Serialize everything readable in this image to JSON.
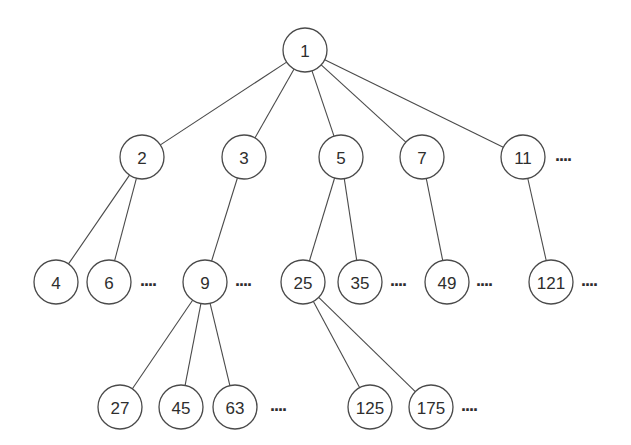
{
  "diagram": {
    "type": "tree",
    "node_radius": 22,
    "colors": {
      "stroke": "#4a4a4a",
      "fill": "#ffffff",
      "text": "#2e2e2e"
    },
    "nodes": [
      {
        "id": "n1",
        "label": "1",
        "x": 305,
        "y": 50
      },
      {
        "id": "n2",
        "label": "2",
        "x": 142,
        "y": 157
      },
      {
        "id": "n3",
        "label": "3",
        "x": 244,
        "y": 157
      },
      {
        "id": "n5",
        "label": "5",
        "x": 341,
        "y": 157
      },
      {
        "id": "n7",
        "label": "7",
        "x": 422,
        "y": 157
      },
      {
        "id": "n11",
        "label": "11",
        "x": 523,
        "y": 157
      },
      {
        "id": "n4",
        "label": "4",
        "x": 56,
        "y": 282
      },
      {
        "id": "n6",
        "label": "6",
        "x": 109,
        "y": 282
      },
      {
        "id": "n9",
        "label": "9",
        "x": 205,
        "y": 282
      },
      {
        "id": "n25",
        "label": "25",
        "x": 303,
        "y": 282
      },
      {
        "id": "n35",
        "label": "35",
        "x": 360,
        "y": 282
      },
      {
        "id": "n49",
        "label": "49",
        "x": 447,
        "y": 282
      },
      {
        "id": "n121",
        "label": "121",
        "x": 551,
        "y": 282
      },
      {
        "id": "n27",
        "label": "27",
        "x": 120,
        "y": 407
      },
      {
        "id": "n45",
        "label": "45",
        "x": 181,
        "y": 407
      },
      {
        "id": "n63",
        "label": "63",
        "x": 235,
        "y": 407
      },
      {
        "id": "n125",
        "label": "125",
        "x": 370,
        "y": 407
      },
      {
        "id": "n175",
        "label": "175",
        "x": 431,
        "y": 407
      }
    ],
    "edges": [
      {
        "from": "n1",
        "to": "n2"
      },
      {
        "from": "n1",
        "to": "n3"
      },
      {
        "from": "n1",
        "to": "n5"
      },
      {
        "from": "n1",
        "to": "n7"
      },
      {
        "from": "n1",
        "to": "n11"
      },
      {
        "from": "n2",
        "to": "n4"
      },
      {
        "from": "n2",
        "to": "n6"
      },
      {
        "from": "n3",
        "to": "n9"
      },
      {
        "from": "n5",
        "to": "n25"
      },
      {
        "from": "n5",
        "to": "n35"
      },
      {
        "from": "n7",
        "to": "n49"
      },
      {
        "from": "n11",
        "to": "n121"
      },
      {
        "from": "n9",
        "to": "n27"
      },
      {
        "from": "n9",
        "to": "n45"
      },
      {
        "from": "n9",
        "to": "n63"
      },
      {
        "from": "n25",
        "to": "n125"
      },
      {
        "from": "n25",
        "to": "n175"
      }
    ],
    "ellipses": [
      {
        "after": "n11",
        "text": "....",
        "x": 555,
        "y": 157
      },
      {
        "after": "n6",
        "text": "....",
        "x": 140,
        "y": 282
      },
      {
        "after": "n9",
        "text": "....",
        "x": 235,
        "y": 282
      },
      {
        "after": "n35",
        "text": "....",
        "x": 390,
        "y": 282
      },
      {
        "after": "n49",
        "text": "....",
        "x": 476,
        "y": 282
      },
      {
        "after": "n121",
        "text": "....",
        "x": 581,
        "y": 282
      },
      {
        "after": "n63",
        "text": "....",
        "x": 270,
        "y": 407
      },
      {
        "after": "n175",
        "text": "....",
        "x": 461,
        "y": 407
      }
    ]
  }
}
